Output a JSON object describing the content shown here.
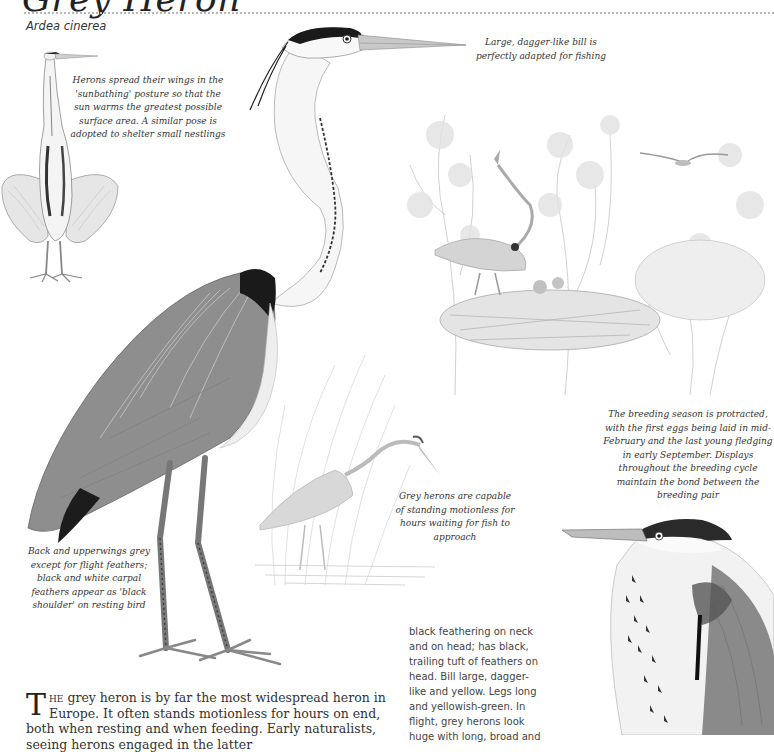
{
  "header": {
    "title": "Grey Heron",
    "species": "Ardea cinerea"
  },
  "captions": {
    "sunbathing": "Herons spread their wings in the 'sunbathing' posture so that the sun warms the greatest possible surface area. A similar pose is adopted to shelter small nestlings",
    "bill": "Large, dagger-like bill is perfectly adapted for fishing",
    "breeding": "The breeding season is protracted, with the first eggs being laid in mid-February and the last young fledging in early September. Displays throughout the breeding cycle maintain the bond between the breeding pair",
    "standing": "Grey herons are capable of standing motionless for hours waiting for fish to approach",
    "back": "Back and upperwings grey except for flight feathers; black and white carpal feathers appear as 'black shoulder' on resting bird"
  },
  "side_text": {
    "lines": [
      "black feathering on neck",
      "and on head; has black,",
      "trailing tuft of feathers on",
      "head. Bill large, dagger-",
      "like and yellow. Legs long",
      "and yellowish-green. In",
      "flight, grey herons look",
      "huge with long, broad and"
    ]
  },
  "body_text": {
    "dropcap": "T",
    "smallcaps": "he",
    "text": " grey heron is by far the most widespread heron in Europe. It often stands motionless for hours on end, both when resting and when feeding. Early naturalists, seeing herons engaged in the latter"
  },
  "illustrations": {
    "sunbathing_heron": "Heron in sunbathing posture with spread wings",
    "main_heron": "Standing grey heron, full body",
    "nest_scene": "Heron at nest with chicks among trees, flying heron above",
    "wading_heron": "Heron wading among reeds",
    "head_portrait": "Close-up portrait of heron head and breast"
  },
  "colors": {
    "ink": "#222222",
    "grey_plumage": "#8a8a8a",
    "light_sketch": "#c8c8c8",
    "rule": "#b8b8b8"
  }
}
